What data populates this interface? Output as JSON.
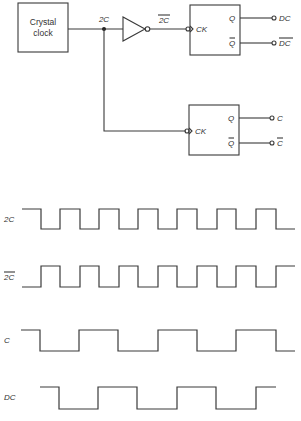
{
  "circuit": {
    "clock_box": {
      "label_line1": "Crystal",
      "label_line2": "clock"
    },
    "signal_2C": "2C",
    "signal_2C_bar": "2C",
    "flipflop_top": {
      "clock_input": "CK",
      "q_label": "Q",
      "qbar_label": "Q",
      "q_output": "DC",
      "qbar_output": "DC"
    },
    "flipflop_bottom": {
      "clock_input": "CK",
      "q_label": "Q",
      "qbar_label": "Q",
      "q_output": "C",
      "qbar_output": "C"
    }
  },
  "timing": {
    "waveforms": [
      {
        "label": "2C",
        "overbar": false,
        "start_level": "high",
        "transitions_x": [
          41,
          60,
          80,
          99,
          119,
          138,
          158,
          177,
          197,
          217,
          236,
          256,
          276
        ],
        "x_start": 22,
        "x_end": 295,
        "y_high": 209,
        "y_low": 229
      },
      {
        "label": "2C",
        "overbar": true,
        "start_level": "low",
        "transitions_x": [
          41,
          60,
          80,
          99,
          119,
          138,
          158,
          177,
          197,
          217,
          236,
          256,
          276
        ],
        "x_start": 22,
        "x_end": 295,
        "y_high": 266,
        "y_low": 287
      },
      {
        "label": "C",
        "overbar": false,
        "start_level": "high",
        "transitions_x": [
          40,
          79,
          118,
          158,
          197,
          236,
          276
        ],
        "x_start": 21,
        "x_end": 295,
        "y_high": 330,
        "y_low": 351
      },
      {
        "label": "DC",
        "overbar": false,
        "start_level": "high",
        "transitions_x": [
          59,
          98,
          137,
          177,
          216,
          256
        ],
        "x_start": 40,
        "x_end": 276,
        "y_high": 387,
        "y_low": 409
      }
    ]
  }
}
